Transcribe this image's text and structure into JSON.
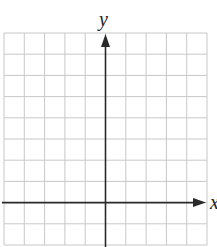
{
  "diagram": {
    "type": "coordinate-plane",
    "axes": {
      "x_label": "x",
      "y_label": "y"
    },
    "grid": {
      "columns": 10,
      "rows": 10,
      "left": 4,
      "right": 207,
      "top": 33,
      "bottom": 245,
      "y_axis_column": 5,
      "x_axis_row": 8
    },
    "colors": {
      "grid": "#c8c8c8",
      "axis": "#2a2a2a",
      "background": "#ffffff"
    }
  }
}
